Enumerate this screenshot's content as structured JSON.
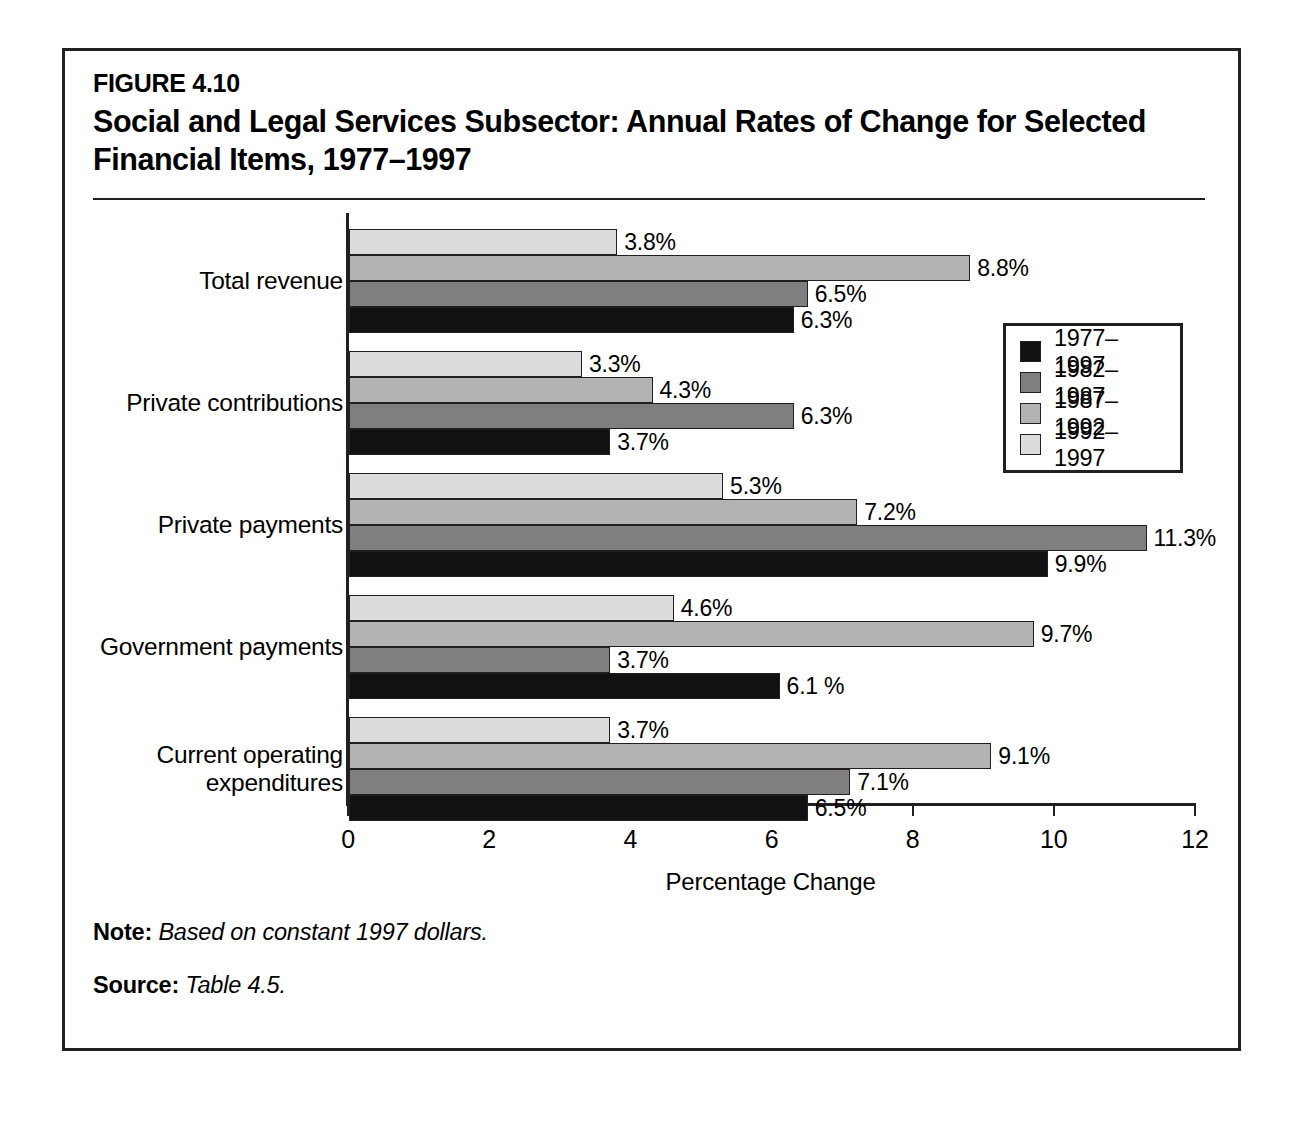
{
  "figure": {
    "number": "FIGURE 4.10",
    "title": "Social and Legal Services Subsector: Annual Rates of Change for Selected Financial Items, 1977–1997"
  },
  "notes": {
    "note_label": "Note:",
    "note_text": "Based on constant 1997 dollars.",
    "source_label": "Source:",
    "source_text": "Table 4.5."
  },
  "legend": {
    "items": [
      {
        "label": "1977–1997",
        "color": "#111111"
      },
      {
        "label": "1982–1987",
        "color": "#7f7f7f"
      },
      {
        "label": "1987–1992",
        "color": "#b3b3b3"
      },
      {
        "label": "1992–1997",
        "color": "#dcdcdc"
      }
    ]
  },
  "chart_data": {
    "type": "bar",
    "orientation": "horizontal",
    "title": "Social and Legal Services Subsector: Annual Rates of Change for Selected Financial Items, 1977–1997",
    "xlabel": "Percentage Change",
    "ylabel": "",
    "xlim": [
      0,
      12
    ],
    "xticks": [
      0,
      2,
      4,
      6,
      8,
      10,
      12
    ],
    "xtick_labels": [
      "0",
      "2",
      "4",
      "6",
      "8",
      "10",
      "12"
    ],
    "grid": false,
    "legend_position": "right",
    "categories": [
      "Total revenue",
      "Private contributions",
      "Private payments",
      "Government payments",
      "Current operating\nexpenditures"
    ],
    "series": [
      {
        "name": "1977–1997",
        "color": "#111111",
        "values": [
          6.3,
          3.7,
          9.9,
          6.1,
          6.5
        ],
        "labels": [
          "6.3%",
          "3.7%",
          "9.9%",
          "6.1 %",
          "6.5%"
        ]
      },
      {
        "name": "1982–1987",
        "color": "#7f7f7f",
        "values": [
          6.5,
          6.3,
          11.3,
          3.7,
          7.1
        ],
        "labels": [
          "6.5%",
          "6.3%",
          "11.3%",
          "3.7%",
          "7.1%"
        ]
      },
      {
        "name": "1987–1992",
        "color": "#b3b3b3",
        "values": [
          8.8,
          4.3,
          7.2,
          9.7,
          9.1
        ],
        "labels": [
          "8.8%",
          "4.3%",
          "7.2%",
          "9.7%",
          "9.1%"
        ]
      },
      {
        "name": "1992–1997",
        "color": "#dcdcdc",
        "values": [
          3.8,
          3.3,
          5.3,
          4.6,
          3.7
        ],
        "labels": [
          "3.8%",
          "3.3%",
          "5.3%",
          "4.6%",
          "3.7%"
        ]
      }
    ]
  }
}
